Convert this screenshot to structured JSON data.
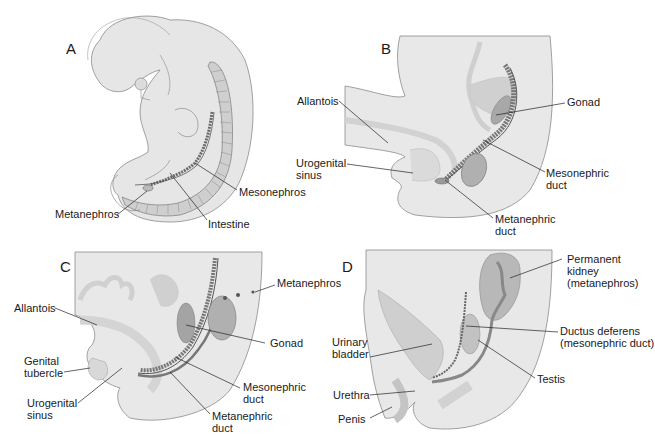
{
  "figure": {
    "colors": {
      "body_fill": "#e6e6e6",
      "body_stroke": "#8a8a8a",
      "organ_light": "#d2d2d2",
      "organ_mid": "#b4b4b4",
      "organ_dark": "#8c8c8c",
      "leader_line": "#222222"
    },
    "panels": [
      {
        "letter": "A",
        "labels": [
          "Mesonephros",
          "Metanephros",
          "Intestine"
        ]
      },
      {
        "letter": "B",
        "labels": [
          "Allantois",
          "Gonad",
          "Urogenital",
          "sinus",
          "Mesonephric",
          "duct",
          "Metanephric",
          "duct"
        ]
      },
      {
        "letter": "C",
        "labels": [
          "Metanephros",
          "Allantois",
          "Gonad",
          "Genital",
          "tubercle",
          "Urogenital",
          "sinus",
          "Mesonephric",
          "duct",
          "Metanephric",
          "duct"
        ]
      },
      {
        "letter": "D",
        "labels": [
          "Permanent",
          "kidney",
          "(metanephros)",
          "Ductus deferens",
          "(mesonephric duct)",
          "Urinary",
          "bladder",
          "Testis",
          "Urethra",
          "Penis"
        ]
      }
    ]
  }
}
